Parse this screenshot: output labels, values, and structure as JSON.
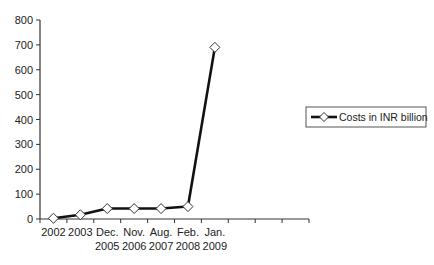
{
  "chart_data": {
    "type": "line",
    "title": "",
    "xlabel": "",
    "ylabel": "",
    "categories": [
      [
        "2002"
      ],
      [
        "2003"
      ],
      [
        "Dec.",
        "2005"
      ],
      [
        "Nov.",
        "2006"
      ],
      [
        "Aug.",
        "2007"
      ],
      [
        "Feb.",
        "2008"
      ],
      [
        "Jan.",
        "2009"
      ]
    ],
    "extra_empty_categories": 3,
    "series": [
      {
        "name": "Costs in INR billion",
        "values": [
          3,
          17,
          42,
          42,
          42,
          50,
          690
        ],
        "color": "#111111",
        "marker": "diamond-open"
      }
    ],
    "ylim": [
      0,
      800
    ],
    "yticks": [
      0,
      100,
      200,
      300,
      400,
      500,
      600,
      700,
      800
    ],
    "grid": false,
    "legend_position": "right"
  }
}
